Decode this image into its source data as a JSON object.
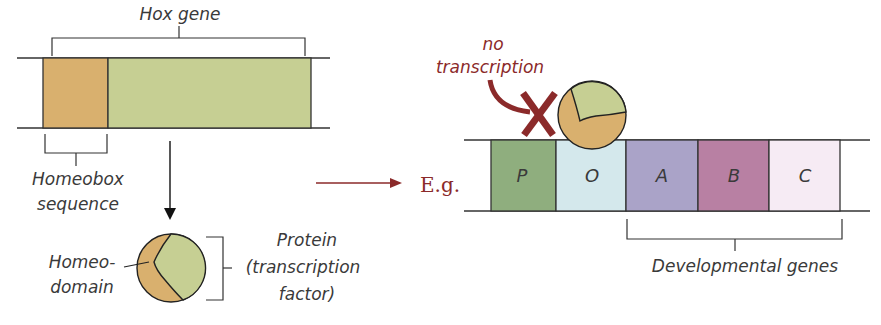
{
  "left_panel": {
    "hox_gene_label": "Hox gene",
    "homeobox_label_line1": "Homeobox",
    "homeobox_label_line2": "sequence",
    "homeodomain_label_line1": "Homeo-",
    "homeodomain_label_line2": "domain",
    "protein_label_line1": "Protein",
    "protein_label_line2": "(transcription",
    "protein_label_line3": "factor)",
    "colors": {
      "homeobox": "#d9b06e",
      "gene_body": "#c6cf93"
    }
  },
  "transition": {
    "eg_label": "E.g."
  },
  "right_panel": {
    "no_transcription_line1": "no",
    "no_transcription_line2": "transcription",
    "developmental_genes_label": "Developmental genes",
    "segments": [
      {
        "label": "P",
        "color": "#8fae7e"
      },
      {
        "label": "O",
        "color": "#d4e8ec"
      },
      {
        "label": "A",
        "color": "#aaa3c8"
      },
      {
        "label": "B",
        "color": "#b880a3"
      },
      {
        "label": "C",
        "color": "#f6ebf4"
      }
    ],
    "accent_color": "#8b2a2a"
  }
}
